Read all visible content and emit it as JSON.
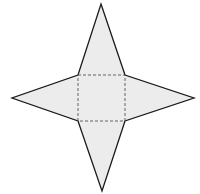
{
  "diagram": {
    "colors": {
      "fill": "#ececec",
      "outline": "#1a1a1a",
      "fold": "#555555",
      "background": "#ffffff"
    },
    "base_square": {
      "x1": 78,
      "y1": 75,
      "x2": 125,
      "y2": 121
    },
    "apexes": {
      "top": [
        101,
        4
      ],
      "bottom": [
        102,
        191
      ],
      "left": [
        12,
        98
      ],
      "right": [
        194,
        98
      ]
    }
  }
}
